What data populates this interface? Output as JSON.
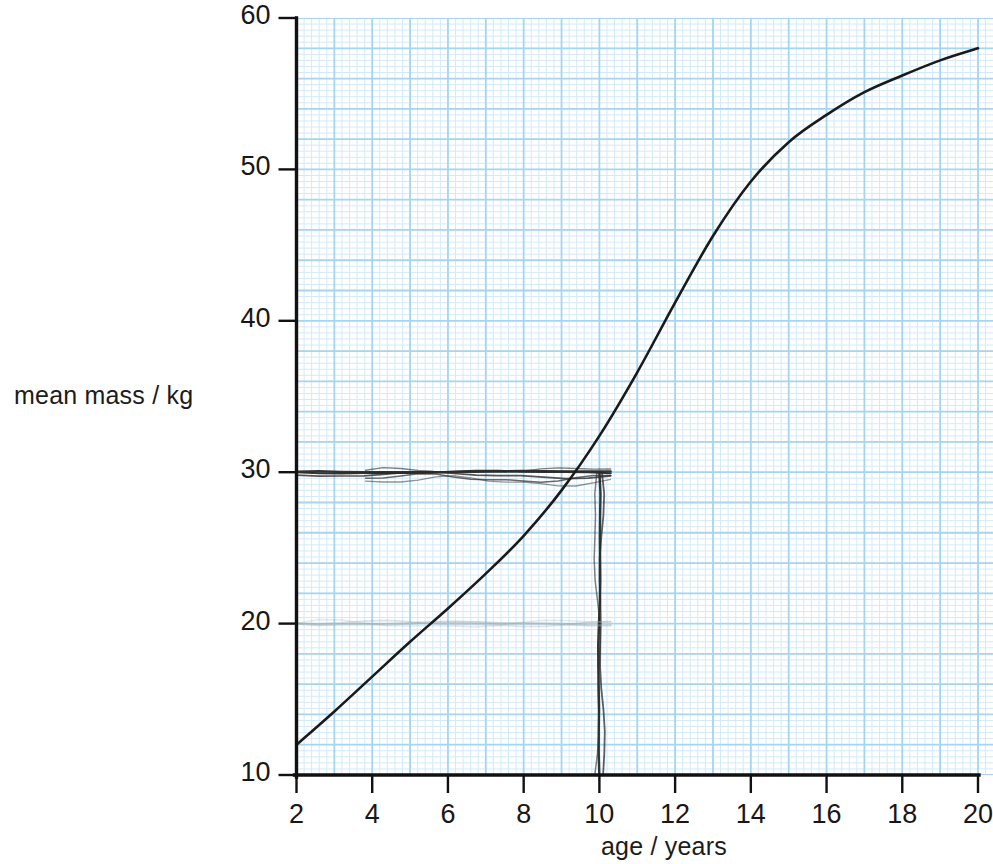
{
  "chart_data": {
    "type": "line",
    "title": "",
    "xlabel": "age / years",
    "ylabel": "mean mass / kg",
    "xlim": [
      2,
      20
    ],
    "ylim": [
      10,
      60
    ],
    "xticks": [
      2,
      4,
      6,
      8,
      10,
      12,
      14,
      16,
      18,
      20
    ],
    "yticks": [
      10,
      20,
      30,
      40,
      50,
      60
    ],
    "xtick_labels": [
      "2",
      "4",
      "6",
      "8",
      "10",
      "12",
      "14",
      "16",
      "18",
      "20"
    ],
    "ytick_labels": [
      "10",
      "20",
      "30",
      "40",
      "50",
      "60"
    ],
    "grid": true,
    "grid_major_step_x": 1,
    "grid_major_step_y": 2,
    "grid_minor_divisions": 5,
    "legend": null,
    "series": [
      {
        "name": "mean mass",
        "color": "#1a1a1a",
        "x": [
          2,
          3,
          4,
          5,
          6,
          7,
          8,
          9,
          10,
          11,
          12,
          13,
          14,
          15,
          16,
          17,
          18,
          19,
          20
        ],
        "values": [
          12.0,
          14.2,
          16.5,
          18.8,
          21.0,
          23.3,
          25.8,
          28.8,
          32.4,
          36.6,
          41.2,
          45.6,
          49.2,
          51.8,
          53.6,
          55.1,
          56.2,
          57.2,
          58.0
        ]
      }
    ],
    "annotations": [
      {
        "name": "horizontal-construction-line",
        "kind": "hand-drawn-horizontal",
        "y": 30,
        "x_start": 2,
        "x_end": 10.3,
        "color": "#2a2a2a"
      },
      {
        "name": "vertical-construction-line",
        "kind": "hand-drawn-vertical",
        "x": 10,
        "y_start": 30,
        "y_end": 10,
        "color": "#2a2a2a"
      },
      {
        "name": "erased-horizontal-line",
        "kind": "hand-drawn-horizontal-faint",
        "y": 20,
        "x_start": 2,
        "x_end": 10.3,
        "color": "#9aa3a8"
      }
    ],
    "colors": {
      "curve": "#1a1a1a",
      "axis": "#111111",
      "grid_minor": "#cfe8f7",
      "grid_major": "#a8d8f0",
      "paper": "#ffffff",
      "annotation": "#2a2a2a",
      "annotation_faint": "#9aa3a8"
    }
  },
  "labels": {
    "ylabel": "mean mass / kg",
    "xlabel": "age / years"
  }
}
